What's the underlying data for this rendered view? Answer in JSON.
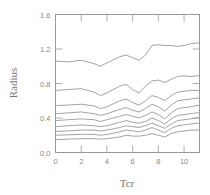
{
  "chart_data": {
    "type": "line",
    "title": "",
    "xlabel": "Tcr",
    "ylabel": "Radius",
    "xlim": [
      0,
      11.2
    ],
    "ylim": [
      0.0,
      1.6
    ],
    "xticks": [
      0,
      2,
      4,
      6,
      8,
      10
    ],
    "yticks": [
      0.0,
      0.4,
      0.8,
      1.2,
      1.6
    ],
    "xtick_labels": [
      "0",
      "2",
      "4",
      "6",
      "8",
      "10"
    ],
    "ytick_labels": [
      "0.0",
      "0.4",
      "0.8",
      "1.2",
      "1.6"
    ],
    "grid": false,
    "legend": "none",
    "x": [
      0,
      1,
      2,
      3,
      3.5,
      4,
      5,
      5.5,
      6,
      6.5,
      7,
      7.5,
      8,
      8.5,
      9,
      9.5,
      10,
      10.5,
      11,
      11.2
    ],
    "series": [
      {
        "name": "curve-1",
        "values": [
          1.06,
          1.05,
          1.07,
          1.03,
          1.0,
          1.04,
          1.11,
          1.13,
          1.1,
          1.07,
          1.13,
          1.24,
          1.25,
          1.24,
          1.24,
          1.23,
          1.24,
          1.26,
          1.27,
          1.27
        ]
      },
      {
        "name": "curve-2",
        "values": [
          0.72,
          0.73,
          0.74,
          0.7,
          0.66,
          0.69,
          0.77,
          0.79,
          0.73,
          0.69,
          0.77,
          0.83,
          0.84,
          0.81,
          0.85,
          0.88,
          0.89,
          0.88,
          0.89,
          0.89
        ]
      },
      {
        "name": "curve-3",
        "values": [
          0.545,
          0.55,
          0.56,
          0.54,
          0.51,
          0.53,
          0.6,
          0.62,
          0.58,
          0.55,
          0.6,
          0.66,
          0.64,
          0.6,
          0.66,
          0.7,
          0.71,
          0.72,
          0.72,
          0.72
        ]
      },
      {
        "name": "curve-4",
        "values": [
          0.45,
          0.46,
          0.47,
          0.45,
          0.43,
          0.45,
          0.5,
          0.52,
          0.49,
          0.47,
          0.51,
          0.56,
          0.53,
          0.48,
          0.55,
          0.6,
          0.61,
          0.62,
          0.63,
          0.63
        ]
      },
      {
        "name": "curve-5",
        "values": [
          0.37,
          0.38,
          0.39,
          0.38,
          0.36,
          0.38,
          0.42,
          0.44,
          0.42,
          0.4,
          0.43,
          0.47,
          0.44,
          0.39,
          0.46,
          0.51,
          0.52,
          0.53,
          0.545,
          0.545
        ]
      },
      {
        "name": "curve-6",
        "values": [
          0.3,
          0.31,
          0.32,
          0.31,
          0.3,
          0.31,
          0.35,
          0.37,
          0.35,
          0.34,
          0.36,
          0.4,
          0.37,
          0.33,
          0.39,
          0.43,
          0.44,
          0.45,
          0.46,
          0.46
        ]
      },
      {
        "name": "curve-7",
        "values": [
          0.245,
          0.25,
          0.26,
          0.26,
          0.25,
          0.26,
          0.29,
          0.31,
          0.3,
          0.29,
          0.31,
          0.34,
          0.31,
          0.28,
          0.33,
          0.37,
          0.38,
          0.39,
          0.4,
          0.4
        ]
      },
      {
        "name": "curve-8",
        "values": [
          0.2,
          0.205,
          0.21,
          0.21,
          0.2,
          0.21,
          0.24,
          0.26,
          0.25,
          0.24,
          0.26,
          0.29,
          0.26,
          0.23,
          0.28,
          0.31,
          0.32,
          0.33,
          0.34,
          0.34
        ]
      },
      {
        "name": "curve-9",
        "values": [
          0.15,
          0.155,
          0.16,
          0.16,
          0.155,
          0.16,
          0.18,
          0.2,
          0.19,
          0.19,
          0.2,
          0.22,
          0.2,
          0.18,
          0.22,
          0.24,
          0.25,
          0.26,
          0.26,
          0.26
        ]
      }
    ]
  }
}
